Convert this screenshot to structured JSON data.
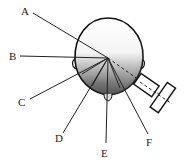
{
  "figure": {
    "labels": [
      {
        "id": "A",
        "text": "A"
      },
      {
        "id": "B",
        "text": "B"
      },
      {
        "id": "C",
        "text": "C"
      },
      {
        "id": "D",
        "text": "D"
      },
      {
        "id": "E",
        "text": "E"
      },
      {
        "id": "F",
        "text": "F"
      }
    ]
  }
}
